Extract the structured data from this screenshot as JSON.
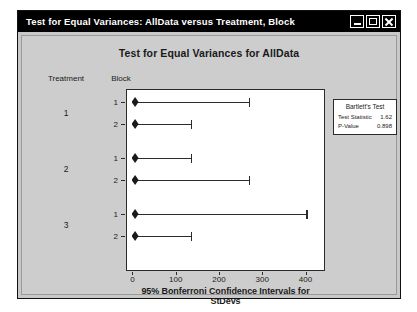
{
  "window": {
    "title": "Test for Equal Variances: AllData versus Treatment, Block",
    "buttons": {
      "minimize": "minimize",
      "maximize": "maximize",
      "close": "close"
    }
  },
  "stub_headers": {
    "treatment": "Treatment",
    "block": "Block"
  },
  "bartlett": {
    "title": "Bartlett's Test",
    "rows": [
      {
        "label": "Test Statistic",
        "value": "1.62"
      },
      {
        "label": "P-Value",
        "value": "0.898"
      }
    ]
  },
  "chart_data": {
    "type": "bar",
    "title": "Test for Equal Variances for AllData",
    "xlabel": "95% Bonferroni Confidence Intervals for StDevs",
    "ylabel": "",
    "xlim": [
      -15,
      445
    ],
    "xticks": [
      0,
      100,
      200,
      300,
      400
    ],
    "xticklabels": [
      "0",
      "100",
      "200",
      "300",
      "400"
    ],
    "grid": false,
    "legend": false,
    "group_label": "Treatment",
    "subgroup_label": "Block",
    "groups": [
      {
        "treatment": "1",
        "rows": [
          {
            "block": "1",
            "point": 6,
            "lower": 6,
            "upper": 270
          },
          {
            "block": "2",
            "point": 6,
            "lower": 6,
            "upper": 136
          }
        ]
      },
      {
        "treatment": "2",
        "rows": [
          {
            "block": "1",
            "point": 6,
            "lower": 6,
            "upper": 136
          },
          {
            "block": "2",
            "point": 6,
            "lower": 6,
            "upper": 270
          }
        ]
      },
      {
        "treatment": "3",
        "rows": [
          {
            "block": "1",
            "point": 6,
            "lower": 6,
            "upper": 403
          },
          {
            "block": "2",
            "point": 6,
            "lower": 6,
            "upper": 136
          }
        ]
      }
    ]
  }
}
